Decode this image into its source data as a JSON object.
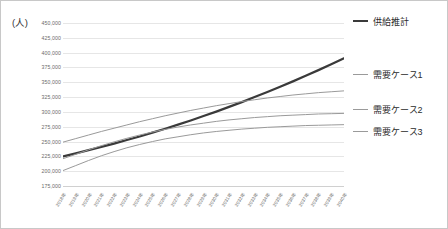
{
  "chart_data": {
    "type": "line",
    "title": "",
    "subtitle": "",
    "unit_label": "(人)",
    "xlabel": "",
    "ylabel": "",
    "grid": true,
    "legend_position": "right",
    "ylim": [
      175000,
      450000
    ],
    "ytick_step": 25000,
    "ytick_labels": [
      "450,000",
      "425,000",
      "400,000",
      "375,000",
      "350,000",
      "325,000",
      "300,000",
      "275,000",
      "250,000",
      "225,000",
      "200,000",
      "175,000"
    ],
    "ytick_values": [
      450000,
      425000,
      400000,
      375000,
      350000,
      325000,
      300000,
      275000,
      250000,
      225000,
      200000,
      175000
    ],
    "categories": [
      "2018年",
      "2019年",
      "2020年",
      "2021年",
      "2022年",
      "2023年",
      "2024年",
      "2025年",
      "2026年",
      "2027年",
      "2028年",
      "2029年",
      "2030年",
      "2031年",
      "2032年",
      "2033年",
      "2034年",
      "2035年",
      "2036年",
      "2037年",
      "2038年",
      "2039年",
      "2040年"
    ],
    "series": [
      {
        "name": "供給推計",
        "color": "#3a3a3a",
        "width": 2.2,
        "values": [
          225000,
          230000,
          235500,
          241000,
          246500,
          252500,
          258500,
          265000,
          271500,
          278500,
          285500,
          293000,
          300500,
          308500,
          316500,
          325000,
          333500,
          342500,
          351500,
          361000,
          370500,
          380500,
          390500
        ]
      },
      {
        "name": "需要ケース1",
        "color": "#9a9a9a",
        "width": 1,
        "values": [
          249000,
          255000,
          261000,
          267000,
          272500,
          278000,
          283500,
          288500,
          293500,
          298000,
          302500,
          306500,
          310500,
          314000,
          317500,
          320500,
          323500,
          326000,
          328500,
          330500,
          332500,
          334000,
          335500
        ]
      },
      {
        "name": "需要ケース2",
        "color": "#9a9a9a",
        "width": 1,
        "values": [
          221000,
          228500,
          236000,
          243000,
          249500,
          255500,
          261000,
          266000,
          270500,
          274500,
          278000,
          281000,
          284000,
          286500,
          288500,
          290500,
          292000,
          293500,
          294500,
          295500,
          296500,
          297000,
          297500
        ]
      },
      {
        "name": "需要ケース3",
        "color": "#9a9a9a",
        "width": 1,
        "values": [
          201000,
          209500,
          218000,
          226000,
          233000,
          239500,
          245000,
          250000,
          254500,
          258000,
          261500,
          264500,
          267000,
          269000,
          271000,
          272500,
          274000,
          275000,
          276000,
          277000,
          277500,
          278000,
          278500
        ]
      }
    ],
    "annotations": []
  },
  "legend": {
    "entries": [
      {
        "label": "供給推計",
        "top": 14,
        "color": "#3a3a3a",
        "thickness": 2.2
      },
      {
        "label": "需要ケース1",
        "top": 67,
        "color": "#9a9a9a",
        "thickness": 1.2
      },
      {
        "label": "需要ケース2",
        "top": 102,
        "color": "#9a9a9a",
        "thickness": 1.2
      },
      {
        "label": "需要ケース3",
        "top": 124,
        "color": "#9a9a9a",
        "thickness": 1.2
      }
    ]
  }
}
